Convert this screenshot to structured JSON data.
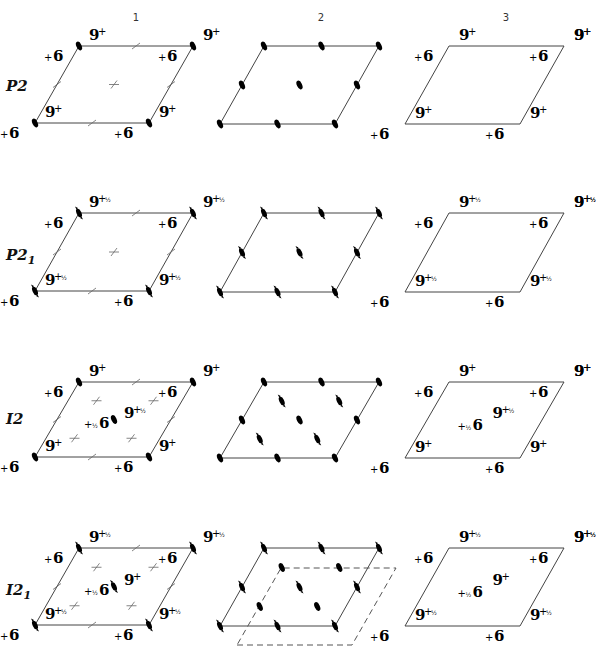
{
  "figure": {
    "column_headers": [
      "1",
      "2",
      "3"
    ],
    "rows": [
      {
        "label": "P2",
        "label_main": "P2",
        "label_sub": "",
        "col1": {
          "description": "Symmetry elements (twofold axes, cell-edge ticks)",
          "objects": [
            {
              "glyph": "9",
              "sign": "+",
              "frac": ""
            },
            {
              "glyph": "6",
              "sign": "+",
              "frac": ""
            }
          ]
        },
        "col2": {
          "description": "Twofold rotation axes (solid ellipses)"
        },
        "col3": {
          "description": "General positions",
          "objects": [
            {
              "glyph": "9",
              "sign": "+",
              "frac": ""
            },
            {
              "glyph": "6",
              "sign": "+",
              "frac": ""
            }
          ]
        }
      },
      {
        "label": "P2₁",
        "label_main": "P2",
        "label_sub": "1",
        "col1": {
          "description": "Symmetry elements (screw axes, cell-edge ticks)",
          "objects": [
            {
              "glyph": "9",
              "sign": "+",
              "frac": "½"
            },
            {
              "glyph": "6",
              "sign": "+",
              "frac": ""
            }
          ]
        },
        "col2": {
          "description": "Twofold screw axes (half-arrow ellipses)"
        },
        "col3": {
          "description": "General positions",
          "objects": [
            {
              "glyph": "9",
              "sign": "+",
              "frac": "½"
            },
            {
              "glyph": "6",
              "sign": "+",
              "frac": ""
            }
          ]
        }
      },
      {
        "label": "I2",
        "label_main": "I2",
        "label_sub": "",
        "col1": {
          "description": "Symmetry elements with body-centering",
          "objects": [
            {
              "glyph": "9",
              "sign": "+",
              "frac": ""
            },
            {
              "glyph": "6",
              "sign": "+",
              "frac": ""
            },
            {
              "glyph": "9",
              "sign": "+",
              "frac": "½"
            },
            {
              "glyph": "6",
              "sign": "+",
              "frac": "½"
            }
          ]
        },
        "col2": {
          "description": "Twofold axes and interleaved screw axes"
        },
        "col3": {
          "description": "General positions",
          "objects": [
            {
              "glyph": "9",
              "sign": "+",
              "frac": ""
            },
            {
              "glyph": "6",
              "sign": "+",
              "frac": ""
            },
            {
              "glyph": "9",
              "sign": "+",
              "frac": "½"
            },
            {
              "glyph": "6",
              "sign": "+",
              "frac": "½"
            }
          ]
        }
      },
      {
        "label": "I2₁",
        "label_main": "I2",
        "label_sub": "1",
        "col1": {
          "description": "Symmetry elements with body-centering",
          "objects": [
            {
              "glyph": "9",
              "sign": "+",
              "frac": "½"
            },
            {
              "glyph": "6",
              "sign": "+",
              "frac": ""
            },
            {
              "glyph": "9",
              "sign": "+",
              "frac": ""
            },
            {
              "glyph": "6",
              "sign": "+",
              "frac": "½"
            }
          ]
        },
        "col2": {
          "description": "Screw axes with shifted (dashed) cell"
        },
        "col3": {
          "description": "General positions",
          "objects": [
            {
              "glyph": "9",
              "sign": "+",
              "frac": "½"
            },
            {
              "glyph": "6",
              "sign": "+",
              "frac": ""
            },
            {
              "glyph": "9",
              "sign": "+",
              "frac": ""
            },
            {
              "glyph": "6",
              "sign": "+",
              "frac": "½"
            }
          ]
        }
      }
    ],
    "glyphs": {
      "nine": "9",
      "six": "6",
      "plus": "+",
      "half": "½"
    }
  }
}
